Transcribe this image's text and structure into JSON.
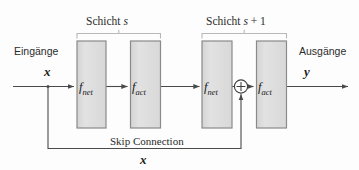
{
  "diagram": {
    "title_alt": "Residual block with skip connection",
    "colors": {
      "background": "#fdfdfd",
      "block_fill": "#dedede",
      "block_border": "#8a8a8a",
      "line": "#4a4a4a",
      "text": "#2b2b2b"
    },
    "labels": {
      "input_caption": "Eingänge",
      "output_caption": "Ausgänge",
      "input_var": "x",
      "output_var": "y",
      "skip_label": "Skip Connection",
      "skip_var": "x"
    },
    "brackets": [
      {
        "text_prefix": "Schicht ",
        "text_var": "s",
        "text_suffix": ""
      },
      {
        "text_prefix": "Schicht ",
        "text_var": "s",
        "text_suffix": " + 1"
      }
    ],
    "blocks": [
      {
        "fn": "f",
        "sub": "net",
        "layer": "s"
      },
      {
        "fn": "f",
        "sub": "act",
        "layer": "s"
      },
      {
        "fn": "f",
        "sub": "net",
        "layer": "s+1"
      },
      {
        "fn": "f",
        "sub": "act",
        "layer": "s+1"
      }
    ],
    "sum_node": {
      "symbol": "+",
      "name": "addition"
    }
  }
}
